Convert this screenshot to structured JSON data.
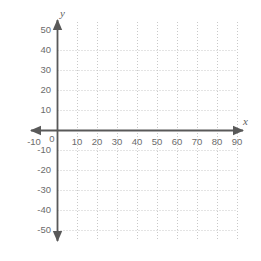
{
  "chart_data": {
    "type": "scatter",
    "title": "",
    "subtitle": "",
    "xlabel": "x",
    "ylabel": "y",
    "xlim": [
      -10,
      90
    ],
    "ylim": [
      -50,
      50
    ],
    "xticks": [
      -10,
      0,
      10,
      20,
      30,
      40,
      50,
      60,
      70,
      80,
      90
    ],
    "yticks": [
      50,
      40,
      30,
      20,
      10,
      -10,
      -20,
      -30,
      -40,
      -50
    ],
    "x_tick_labels": [
      "-10",
      "0",
      "10",
      "20",
      "30",
      "40",
      "50",
      "60",
      "70",
      "80",
      "90"
    ],
    "y_tick_labels": [
      "50",
      "40",
      "30",
      "20",
      "10",
      "-10",
      "-20",
      "-30",
      "-40",
      "-50"
    ],
    "series": [],
    "values": [],
    "grid": true,
    "grid_style": "dotted",
    "grid_x_range": [
      0,
      90
    ],
    "grid_y_range": [
      -50,
      40
    ],
    "legend": false,
    "legend_position": "none",
    "axis_arrows": [
      "up",
      "down",
      "left",
      "right"
    ],
    "annotations": []
  },
  "axes": {
    "x_axis_label": "x",
    "y_axis_label": "y",
    "origin_label": "0"
  },
  "colors": {
    "background": "#ffffff",
    "axis_line": "#595959",
    "grid_line": "#c9c9c9",
    "tick_text": "#6c6c6c",
    "axis_name_text": "#5f5f5f"
  },
  "ticks": {
    "x": [
      {
        "label": "-10",
        "value": -10,
        "px": 37
      },
      {
        "label": "0",
        "value": 0,
        "px": 57
      },
      {
        "label": "10",
        "value": 10,
        "px": 77
      },
      {
        "label": "20",
        "value": 20,
        "px": 97
      },
      {
        "label": "30",
        "value": 30,
        "px": 117
      },
      {
        "label": "40",
        "value": 40,
        "px": 137
      },
      {
        "label": "50",
        "value": 50,
        "px": 157
      },
      {
        "label": "60",
        "value": 60,
        "px": 177
      },
      {
        "label": "70",
        "value": 70,
        "px": 197
      },
      {
        "label": "80",
        "value": 80,
        "px": 217
      },
      {
        "label": "90",
        "value": 90,
        "px": 237
      }
    ],
    "y": [
      {
        "label": "50",
        "value": 50,
        "px": 30
      },
      {
        "label": "40",
        "value": 40,
        "px": 50
      },
      {
        "label": "30",
        "value": 30,
        "px": 70
      },
      {
        "label": "20",
        "value": 20,
        "px": 90
      },
      {
        "label": "10",
        "value": 10,
        "px": 110
      },
      {
        "label": "-10",
        "value": -10,
        "px": 150
      },
      {
        "label": "-20",
        "value": -20,
        "px": 170
      },
      {
        "label": "-30",
        "value": -30,
        "px": 190
      },
      {
        "label": "-40",
        "value": -40,
        "px": 210
      },
      {
        "label": "-50",
        "value": -50,
        "px": 230
      }
    ]
  }
}
